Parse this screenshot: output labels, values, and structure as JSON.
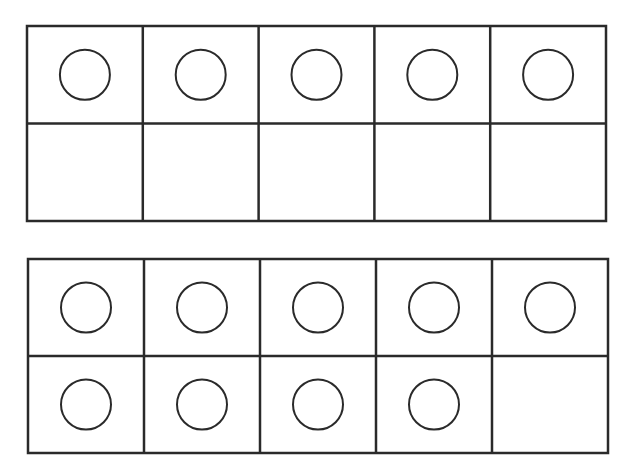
{
  "diagram": {
    "type": "ten-frames",
    "stroke_color": "#2a2a2a",
    "background": "#ffffff",
    "frames": [
      {
        "name": "ten-frame-1",
        "x": 27,
        "y": 26,
        "width": 579,
        "height": 195,
        "rows": 2,
        "cols": 5,
        "filled": [
          [
            true,
            true,
            true,
            true,
            true
          ],
          [
            false,
            false,
            false,
            false,
            false
          ]
        ],
        "count": 5
      },
      {
        "name": "ten-frame-2",
        "x": 28,
        "y": 259,
        "width": 580,
        "height": 194,
        "rows": 2,
        "cols": 5,
        "filled": [
          [
            true,
            true,
            true,
            true,
            true
          ],
          [
            true,
            true,
            true,
            true,
            false
          ]
        ],
        "count": 9
      }
    ],
    "counter_radius": 25
  }
}
